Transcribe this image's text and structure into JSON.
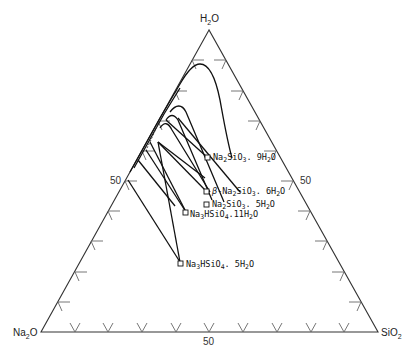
{
  "diagram": {
    "type": "ternary-phase-diagram",
    "vertices": {
      "top": "H₂O",
      "left": "Na₂O",
      "right": "SiO₂"
    },
    "axis_labels": {
      "left_edge_mid": "50",
      "right_edge_mid": "50",
      "bottom_edge_mid": "50"
    },
    "phases": [
      {
        "name": "Na₂SiO₃.9H₂O",
        "label": "Na2SiO3 . 9H2O"
      },
      {
        "name": "β-Na₂SiO₃.6H₂O",
        "label": "β-Na2SiO3 . 6H2O"
      },
      {
        "name": "Na₂SiO₃.5H₂O",
        "label": "Na2SiO3 . 5H2O"
      },
      {
        "name": "Na₃HSiO₄.11H₂O",
        "label": "Na3HSiO4 . 11H2O"
      },
      {
        "name": "Na₃HSiO₄.5H₂O",
        "label": "Na3HSiO4 . 5H2O"
      }
    ],
    "colors": {
      "lines": "#111111",
      "ticks": "#666666",
      "background": "#ffffff"
    }
  }
}
